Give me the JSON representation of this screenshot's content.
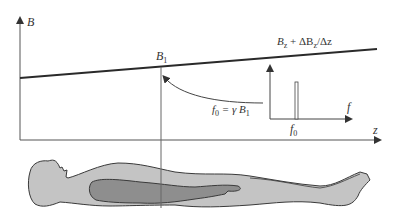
{
  "diagram": {
    "axis_y_label": "B",
    "axis_x_label": "z",
    "point_label_main": "B",
    "point_label_sub": "1",
    "gradient_label": "B",
    "gradient_label_sub": "z",
    "gradient_label_rest": " + ΔB",
    "gradient_label_sub2": "z",
    "gradient_label_end": "/Δz",
    "equation_f": "f",
    "equation_f_sub": "0",
    "equation_rest": " = γ B",
    "equation_sub": "1",
    "inset_axis_label": "f",
    "inset_tick_label": "f",
    "inset_tick_sub": "0",
    "colors": {
      "line": "#2a2a2a",
      "axis": "#555555",
      "body_fill": "#c4c4c4",
      "organ_fill": "#8e8e8e",
      "outline": "#3a3a3a"
    }
  }
}
